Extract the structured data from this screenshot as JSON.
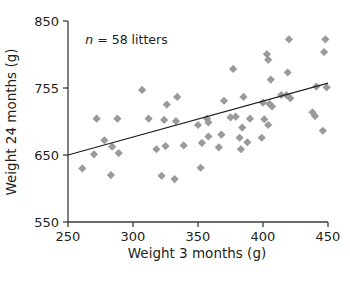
{
  "chart_data": {
    "type": "scatter",
    "title": "",
    "xlabel": "Weight 3 months (g)",
    "ylabel": "Weight 24 months (g)",
    "xlim": [
      250,
      450
    ],
    "ylim": [
      550,
      850
    ],
    "xticks": [
      250,
      300,
      350,
      400,
      450
    ],
    "yticks": [
      550,
      650,
      755,
      850
    ],
    "xtick_labels": [
      "250",
      "300",
      "350",
      "400",
      "450"
    ],
    "ytick_labels": [
      "550",
      "650",
      "755",
      "850"
    ],
    "grid": false,
    "legend": null,
    "annotations": [
      {
        "text_italic": "n",
        "text": " = 58 litters",
        "x": 295,
        "y": 818
      }
    ],
    "marker": {
      "shape": "diamond",
      "color": "#9a9a9a",
      "size": 7
    },
    "series": [
      {
        "name": "litters",
        "n": 58,
        "points": [
          [
            261,
            630
          ],
          [
            270,
            651
          ],
          [
            272,
            707
          ],
          [
            278,
            673
          ],
          [
            283,
            620
          ],
          [
            284,
            663
          ],
          [
            288,
            707
          ],
          [
            289,
            653
          ],
          [
            307,
            752
          ],
          [
            312,
            707
          ],
          [
            318,
            659
          ],
          [
            322,
            619
          ],
          [
            324,
            705
          ],
          [
            325,
            664
          ],
          [
            326,
            729
          ],
          [
            332,
            614
          ],
          [
            333,
            703
          ],
          [
            334,
            741
          ],
          [
            339,
            665
          ],
          [
            350,
            697
          ],
          [
            352,
            631
          ],
          [
            353,
            669
          ],
          [
            357,
            707
          ],
          [
            358,
            701
          ],
          [
            358,
            679
          ],
          [
            366,
            662
          ],
          [
            368,
            682
          ],
          [
            370,
            735
          ],
          [
            375,
            709
          ],
          [
            377,
            782
          ],
          [
            379,
            710
          ],
          [
            382,
            677
          ],
          [
            383,
            659
          ],
          [
            384,
            693
          ],
          [
            385,
            741
          ],
          [
            388,
            670
          ],
          [
            390,
            707
          ],
          [
            399,
            677
          ],
          [
            400,
            732
          ],
          [
            401,
            706
          ],
          [
            403,
            803
          ],
          [
            404,
            795
          ],
          [
            404,
            697
          ],
          [
            405,
            730
          ],
          [
            406,
            767
          ],
          [
            407,
            726
          ],
          [
            414,
            744
          ],
          [
            418,
            744
          ],
          [
            419,
            777
          ],
          [
            420,
            824
          ],
          [
            421,
            739
          ],
          [
            438,
            717
          ],
          [
            440,
            711
          ],
          [
            441,
            757
          ],
          [
            446,
            688
          ],
          [
            447,
            806
          ],
          [
            448,
            824
          ],
          [
            449,
            756
          ]
        ]
      }
    ],
    "trendline": {
      "type": "linear",
      "x_start": 250,
      "y_start": 650,
      "x_end": 450,
      "y_end": 762,
      "color": "#231f20"
    }
  }
}
